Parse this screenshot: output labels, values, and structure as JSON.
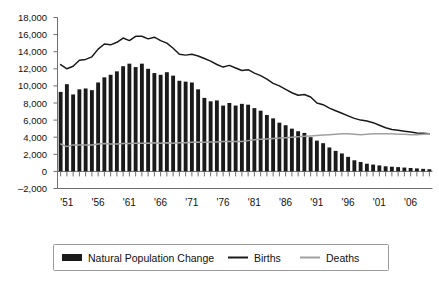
{
  "chart_data": {
    "type": "bar",
    "title": "",
    "xlabel": "",
    "ylabel": "",
    "ylim": [
      -2000,
      18000
    ],
    "ytick_values": [
      -2000,
      0,
      2000,
      4000,
      6000,
      8000,
      10000,
      12000,
      14000,
      16000,
      18000
    ],
    "ytick_labels": [
      "–2,000",
      "0",
      "2,000",
      "4,000",
      "6,000",
      "8,000",
      "10,000",
      "12,000",
      "14,000",
      "16,000",
      "18,000"
    ],
    "grid": false,
    "legend_position": "bottom",
    "x": [
      1950,
      1951,
      1952,
      1953,
      1954,
      1955,
      1956,
      1957,
      1958,
      1959,
      1960,
      1961,
      1962,
      1963,
      1964,
      1965,
      1966,
      1967,
      1968,
      1969,
      1970,
      1971,
      1972,
      1973,
      1974,
      1975,
      1976,
      1977,
      1978,
      1979,
      1980,
      1981,
      1982,
      1983,
      1984,
      1985,
      1986,
      1987,
      1988,
      1989,
      1990,
      1991,
      1992,
      1993,
      1994,
      1995,
      1996,
      1997,
      1998,
      1999,
      2000,
      2001,
      2002,
      2003,
      2004,
      2005,
      2006,
      2007,
      2008,
      2009
    ],
    "xtick_labels": [
      "'51",
      "'56",
      "'61",
      "'66",
      "'71",
      "'76",
      "'81",
      "'86",
      "'91",
      "'96",
      "'01",
      "'06"
    ],
    "xtick_values": [
      1951,
      1956,
      1961,
      1966,
      1971,
      1976,
      1981,
      1986,
      1991,
      1996,
      2001,
      2006
    ],
    "series": [
      {
        "name": "Natural Population Change",
        "kind": "bar",
        "color": "#1a1a1a",
        "values": [
          9300,
          10200,
          9000,
          9600,
          9700,
          9500,
          10400,
          11000,
          11300,
          11700,
          12300,
          12600,
          12200,
          12600,
          12000,
          11500,
          11300,
          11600,
          11200,
          10600,
          10500,
          10400,
          9600,
          8600,
          8200,
          8300,
          7700,
          8000,
          7700,
          7900,
          7800,
          7400,
          7100,
          6600,
          6200,
          5700,
          5400,
          5000,
          4700,
          4500,
          4000,
          3600,
          3300,
          2800,
          2400,
          2100,
          1700,
          1300,
          1100,
          900,
          800,
          700,
          600,
          550,
          500,
          450,
          400,
          350,
          300,
          250
        ]
      },
      {
        "name": "Births",
        "kind": "line",
        "color": "#1a1a1a",
        "values": [
          12500,
          12000,
          12300,
          13000,
          13100,
          13400,
          14300,
          14900,
          14800,
          15100,
          15600,
          15300,
          15800,
          15800,
          15500,
          15700,
          15300,
          15000,
          14400,
          13700,
          13600,
          13700,
          13500,
          13200,
          12900,
          12500,
          12200,
          12400,
          12100,
          11800,
          11900,
          11500,
          11200,
          10800,
          10300,
          10000,
          9600,
          9200,
          8900,
          9000,
          8700,
          8000,
          7800,
          7400,
          7100,
          6800,
          6500,
          6200,
          6000,
          5900,
          5700,
          5400,
          5100,
          4900,
          4800,
          4700,
          4600,
          4500,
          4450,
          4400
        ]
      },
      {
        "name": "Deaths",
        "kind": "line",
        "color": "#a0a0a0",
        "values": [
          3200,
          2900,
          3100,
          3100,
          3100,
          3100,
          3200,
          3250,
          3200,
          3200,
          3250,
          3250,
          3300,
          3300,
          3300,
          3350,
          3300,
          3350,
          3300,
          3350,
          3350,
          3400,
          3400,
          3400,
          3450,
          3450,
          3500,
          3500,
          3500,
          3500,
          3600,
          3700,
          3750,
          3800,
          3850,
          3900,
          3950,
          4000,
          4050,
          4100,
          4150,
          4200,
          4250,
          4300,
          4350,
          4400,
          4400,
          4350,
          4300,
          4350,
          4400,
          4400,
          4400,
          4400,
          4350,
          4350,
          4300,
          4300,
          4350,
          4400
        ]
      }
    ]
  },
  "legend": {
    "items": [
      {
        "label": "Natural Population Change",
        "marker": "bar-swatch",
        "color": "#1a1a1a"
      },
      {
        "label": "Births",
        "marker": "line-swatch",
        "color": "#1a1a1a"
      },
      {
        "label": "Deaths",
        "marker": "line-swatch",
        "color": "#a0a0a0"
      }
    ]
  }
}
